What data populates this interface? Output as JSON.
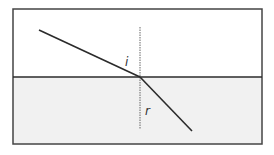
{
  "diagram": {
    "title": "",
    "labels": {
      "incidence_angle": "i",
      "refraction_angle": "r"
    },
    "colors": {
      "line": "#2b2b2b",
      "upper_medium": "#ffffff",
      "lower_medium": "#f1f1f1",
      "normal": "#666666"
    },
    "elements": [
      {
        "type": "boundary-box",
        "x": 13,
        "y": 9,
        "width": 249,
        "height": 135
      },
      {
        "type": "interface-line",
        "y": 77
      },
      {
        "type": "normal-line",
        "style": "dashed",
        "x": 140,
        "y1": 27,
        "y2": 129
      },
      {
        "type": "incident-ray",
        "from": [
          39,
          30
        ],
        "to": [
          140,
          77
        ]
      },
      {
        "type": "refracted-ray",
        "from": [
          140,
          77
        ],
        "to": [
          192,
          131
        ]
      }
    ]
  }
}
